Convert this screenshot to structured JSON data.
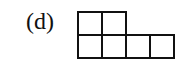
{
  "figure": {
    "label": "(d)",
    "rows": [
      {
        "cells": 2
      },
      {
        "cells": 4
      }
    ],
    "line_color": "#111111"
  }
}
